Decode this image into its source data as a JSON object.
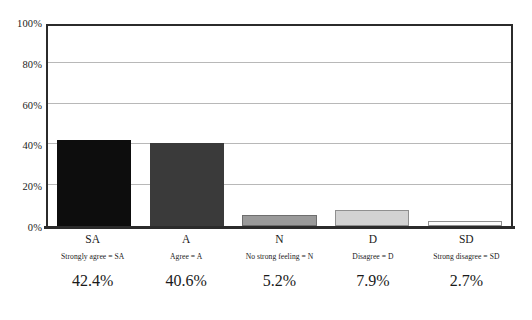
{
  "chart_data": {
    "type": "bar",
    "title": "",
    "subtitle": "",
    "xlabel": "",
    "ylabel": "",
    "categories": [
      "SA",
      "A",
      "N",
      "D",
      "SD"
    ],
    "values": [
      42.4,
      40.6,
      5.2,
      7.9,
      2.7
    ],
    "value_labels": [
      "42.4%",
      "40.6%",
      "5.2%",
      "7.9%",
      "2.7%"
    ],
    "category_legends": [
      "Strongly agree = SA",
      "Agree = A",
      "No strong feeling = N",
      "Disagree = D",
      "Strong disagree = SD"
    ],
    "bar_colors": [
      "#0d0d0d",
      "#3a3a3a",
      "#9a9a9a",
      "#d2d2d2",
      "#fcfcfc"
    ],
    "bar_border_colors": [
      "#0d0d0d",
      "#3a3a3a",
      "#6e6e6e",
      "#8f8f8f",
      "#8f8f8f"
    ],
    "ylim": [
      0,
      100
    ],
    "ytick_values": [
      0,
      20,
      40,
      60,
      80,
      100
    ],
    "ytick_labels": [
      "0%",
      "20%",
      "40%",
      "60%",
      "80%",
      "100%"
    ],
    "grid": true,
    "grid_axis": "y",
    "legend": false,
    "legend_position": "none",
    "axis_color": "#2b2b2b",
    "gridline_color": "#b8b8b8",
    "background_color": "#ffffff"
  }
}
